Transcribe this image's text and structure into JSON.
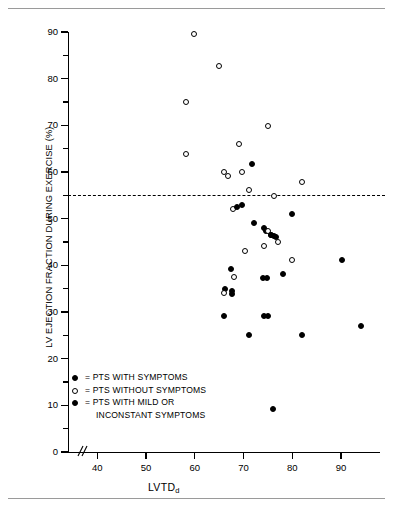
{
  "figure": {
    "top_rule": "",
    "bottom_rule": ""
  },
  "chart_data": {
    "type": "scatter",
    "title": "",
    "xlabel": "LVTD",
    "xlabel_sub": "d",
    "ylabel": "LV EJECTION FRACTION DURING EXERCISE (%)",
    "xlim": [
      34,
      98
    ],
    "ylim": [
      0,
      90
    ],
    "xticks": [
      40,
      50,
      60,
      70,
      80,
      90
    ],
    "yticks": [
      0,
      10,
      20,
      30,
      40,
      50,
      60,
      70,
      80,
      90
    ],
    "yticks_minor": [
      5,
      15,
      25,
      35,
      45,
      55,
      65,
      75,
      85
    ],
    "grid": false,
    "axis_break_x": true,
    "annotations": [
      {
        "type": "hline",
        "y": 55,
        "style": "dashed",
        "label": ""
      }
    ],
    "legend_position": "lower-left",
    "series": [
      {
        "name": "PTS WITH SYMPTOMS",
        "marker": "filled-circle",
        "color": "#000000",
        "points": [
          [
            71.8,
            61.8
          ],
          [
            79.9,
            51.0
          ],
          [
            72.2,
            49.0
          ],
          [
            74.2,
            48.0
          ],
          [
            74.6,
            47.4
          ],
          [
            75.6,
            46.6
          ],
          [
            76.2,
            46.2
          ],
          [
            76.6,
            46.0
          ],
          [
            90.2,
            41.2
          ],
          [
            78.1,
            38.2
          ],
          [
            67.4,
            39.2
          ],
          [
            74.0,
            37.2
          ],
          [
            74.8,
            37.2
          ],
          [
            66.2,
            35.0
          ],
          [
            67.6,
            34.6
          ],
          [
            67.6,
            33.8
          ],
          [
            65.9,
            29.1
          ],
          [
            74.2,
            29.1
          ],
          [
            75.1,
            29.1
          ],
          [
            94.0,
            27.1
          ],
          [
            71.1,
            25.1
          ],
          [
            82.0,
            25.1
          ],
          [
            76.1,
            9.3
          ]
        ]
      },
      {
        "name": "PTS WITHOUT SYMPTOMS",
        "marker": "open-circle",
        "color": "#000000",
        "points": [
          [
            59.8,
            89.5
          ],
          [
            64.9,
            82.7
          ],
          [
            58.2,
            75.0
          ],
          [
            75.1,
            69.9
          ],
          [
            69.0,
            65.9
          ],
          [
            58.3,
            63.9
          ],
          [
            66.1,
            60.1
          ],
          [
            66.9,
            59.2
          ],
          [
            69.7,
            60.1
          ],
          [
            81.9,
            57.9
          ],
          [
            71.2,
            56.1
          ],
          [
            76.2,
            54.8
          ],
          [
            67.9,
            52.0
          ],
          [
            75.0,
            47.4
          ],
          [
            77.0,
            45.1
          ],
          [
            74.2,
            44.2
          ],
          [
            70.4,
            43.1
          ],
          [
            80.0,
            41.1
          ],
          [
            68.0,
            37.4
          ],
          [
            66.0,
            34.0
          ]
        ]
      },
      {
        "name": "PTS WITH MILD OR INCONSTANT SYMPTOMS",
        "marker": "half-filled-circle",
        "color": "#000000",
        "points": [
          [
            69.6,
            52.9
          ],
          [
            68.7,
            52.4
          ],
          [
            75.6,
            46.6
          ]
        ]
      }
    ]
  },
  "legend": {
    "items": [
      {
        "marker": "filled-circle",
        "equals": "=",
        "label": "PTS WITH SYMPTOMS",
        "cont": ""
      },
      {
        "marker": "open-circle",
        "equals": "=",
        "label": "PTS WITHOUT SYMPTOMS",
        "cont": ""
      },
      {
        "marker": "half-filled-circle",
        "equals": "=",
        "label": "PTS WITH MILD OR",
        "cont": "INCONSTANT SYMPTOMS"
      }
    ]
  }
}
